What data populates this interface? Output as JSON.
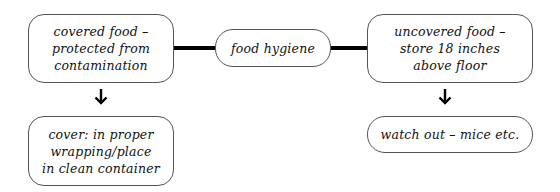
{
  "diagram": {
    "center": {
      "label": "food hygiene"
    },
    "left_top": {
      "label": "covered food –\nprotected from\ncontamination"
    },
    "right_top": {
      "label": "uncovered food –\nstore 18 inches\nabove floor"
    },
    "left_bottom": {
      "label": "cover: in proper\nwrapping/place\nin clean container"
    },
    "right_bottom": {
      "label": "watch out – mice etc."
    }
  }
}
